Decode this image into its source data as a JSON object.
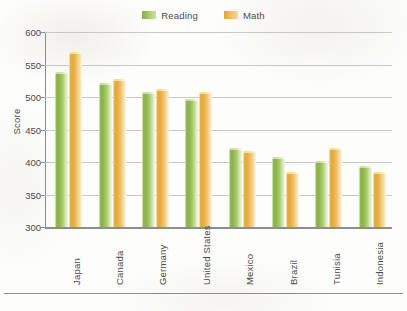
{
  "legend": {
    "entries": [
      {
        "label": "Reading",
        "color": "#8cb44b",
        "swatch": "reading-swatch"
      },
      {
        "label": "Math",
        "color": "#e8a93c",
        "swatch": "math-swatch"
      }
    ]
  },
  "axes": {
    "ylabel": "Score",
    "yticks": [
      "300",
      "350",
      "400",
      "450",
      "500",
      "550",
      "600"
    ]
  },
  "artifacts": {
    "corner_mark": "",
    "bleed_text": ""
  },
  "chart_data": {
    "type": "bar",
    "title": "",
    "xlabel": "",
    "ylabel": "Score",
    "ylim": [
      300,
      600
    ],
    "ytick_step": 50,
    "grid": true,
    "legend_position": "top-center",
    "categories": [
      "Japan",
      "Canada",
      "Germany",
      "United States",
      "Mexico",
      "Brazil",
      "Tunisia",
      "Indonesia"
    ],
    "series": [
      {
        "name": "Reading",
        "color": "#8cb44b",
        "values": [
          538,
          522,
          507,
          497,
          422,
          408,
          402,
          394
        ]
      },
      {
        "name": "Math",
        "color": "#e8a93c",
        "values": [
          570,
          527,
          512,
          508,
          417,
          384,
          422,
          384
        ]
      }
    ]
  }
}
